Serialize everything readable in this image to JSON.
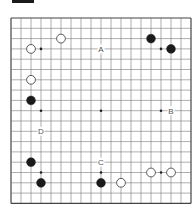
{
  "diagram": {
    "type": "go-board",
    "size": 19,
    "origin": {
      "x": 11,
      "y": 18
    },
    "spacing": {
      "x": 10.0,
      "y": 10.3
    },
    "colors": {
      "line": "#777777",
      "border": "#444444",
      "black_stone": "#1a1a1a",
      "white_stone_fill": "#ffffff",
      "white_stone_stroke": "#333333",
      "label": "#555555",
      "header_bar": "#1a1a1a"
    },
    "star_points": [
      [
        3,
        3
      ],
      [
        9,
        3
      ],
      [
        15,
        3
      ],
      [
        3,
        9
      ],
      [
        9,
        9
      ],
      [
        15,
        9
      ],
      [
        3,
        15
      ],
      [
        9,
        15
      ],
      [
        15,
        15
      ]
    ],
    "stones": [
      {
        "color": "white",
        "col": 5,
        "row": 2
      },
      {
        "color": "white",
        "col": 2,
        "row": 3
      },
      {
        "color": "black",
        "col": 14,
        "row": 2
      },
      {
        "color": "black",
        "col": 16,
        "row": 3
      },
      {
        "color": "white",
        "col": 2,
        "row": 6
      },
      {
        "color": "black",
        "col": 2,
        "row": 8
      },
      {
        "color": "black",
        "col": 2,
        "row": 14
      },
      {
        "color": "black",
        "col": 3,
        "row": 16
      },
      {
        "color": "black",
        "col": 9,
        "row": 16
      },
      {
        "color": "white",
        "col": 11,
        "row": 16
      },
      {
        "color": "white",
        "col": 14,
        "row": 15
      },
      {
        "color": "white",
        "col": 16,
        "row": 15
      }
    ],
    "labels": [
      {
        "text": "A",
        "col": 9,
        "row": 3
      },
      {
        "text": "B",
        "col": 16,
        "row": 9
      },
      {
        "text": "C",
        "col": 9,
        "row": 14
      },
      {
        "text": "D",
        "col": 3,
        "row": 11
      }
    ]
  }
}
